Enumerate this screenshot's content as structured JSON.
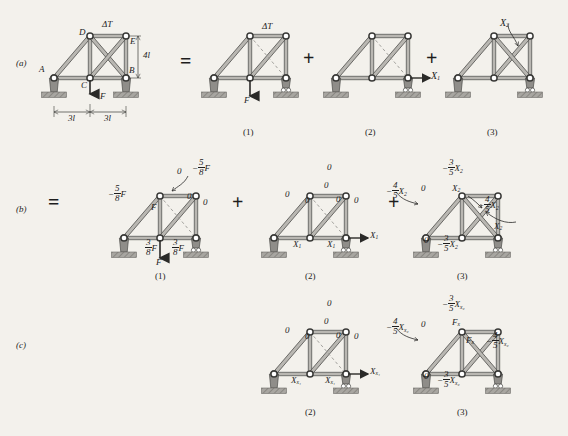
{
  "figure": {
    "caption_rows": [
      {
        "id": "row-a",
        "label": "(a)"
      },
      {
        "id": "row-b",
        "label": "(b)"
      },
      {
        "id": "row-c",
        "label": "(c)"
      }
    ],
    "operators": {
      "equals": "=",
      "plus": "+"
    }
  },
  "row_a": {
    "label": "(a)",
    "panel_0": {
      "joint_labels": {
        "A": "A",
        "B": "B",
        "C": "C",
        "D": "D",
        "E": "E"
      },
      "temperature_label": "ΔT",
      "height_dim": "4l",
      "span_left": "3l",
      "span_right": "3l",
      "load_label": "F"
    },
    "panel_1": {
      "number": "(1)",
      "temperature_label": "ΔT",
      "load_label": "F"
    },
    "panel_2": {
      "number": "(2)",
      "redundant_label": "X",
      "redundant_sub": "1"
    },
    "panel_3": {
      "number": "(3)",
      "redundant_label": "X",
      "redundant_sub": "2"
    }
  },
  "row_b": {
    "label": "(b)",
    "panel_1": {
      "number": "(1)",
      "top_chord": "0",
      "top_right_force": {
        "sign": "−",
        "num": "5",
        "den": "8",
        "symbol": "F"
      },
      "left_diagonal_force": {
        "sign": "−",
        "num": "5",
        "den": "8",
        "symbol": "F"
      },
      "vertical_force": "F",
      "diag_zero": "0",
      "right_vertical_zero": "0",
      "bottom_left_force": {
        "num": "3",
        "den": "8",
        "symbol": "F"
      },
      "bottom_right_force": {
        "num": "3",
        "den": "8",
        "symbol": "F"
      },
      "load_label": "F"
    },
    "panel_2": {
      "number": "(2)",
      "top_zero": "0",
      "left_diag_zero": "0",
      "inner_diag_zero": "0",
      "center_vertical_zero": "0",
      "right_diag_zero": "0",
      "right_vertical_zero": "0",
      "bottom_left": {
        "symbol": "X",
        "sub": "1"
      },
      "bottom_right": {
        "symbol": "X",
        "sub": "1"
      },
      "applied": {
        "symbol": "X",
        "sub": "1"
      }
    },
    "panel_3": {
      "number": "(3)",
      "top_force": {
        "sign": "−",
        "num": "3",
        "den": "5",
        "symbol": "X",
        "sub": "2"
      },
      "left_force": {
        "sign": "−",
        "num": "4",
        "den": "5",
        "symbol": "X",
        "sub": "2"
      },
      "left_zero": "0",
      "diag_label": {
        "symbol": "X",
        "sub": "2"
      },
      "right_force": {
        "sign": "−",
        "num": "4",
        "den": "5",
        "symbol": "X",
        "sub": "2"
      },
      "right_diag_label": {
        "symbol": "X",
        "sub": "2"
      },
      "bottom_zero": "0",
      "bottom_force": {
        "sign": "−",
        "num": "3",
        "den": "5",
        "symbol": "X",
        "sub": "2"
      }
    }
  },
  "row_c": {
    "label": "(c)",
    "panel_2": {
      "number": "(2)",
      "top_zero": "0",
      "left_diag_zero": "0",
      "inner_diag_zero": "0",
      "center_vertical_zero": "0",
      "right_diag_zero": "0",
      "right_vertical_zero": "0",
      "bottom_left": {
        "symbol": "X",
        "sub": "x₁"
      },
      "bottom_right": {
        "symbol": "X",
        "sub": "x₁"
      },
      "applied": {
        "symbol": "X",
        "sub": "x₁"
      }
    },
    "panel_3": {
      "number": "(3)",
      "top_force": {
        "sign": "−",
        "num": "3",
        "den": "5",
        "symbol": "X",
        "sub": "x₂"
      },
      "left_force": {
        "sign": "−",
        "num": "4",
        "den": "5",
        "symbol": "X",
        "sub": "x₂"
      },
      "left_zero": "0",
      "diag_label": {
        "symbol": "F",
        "sub": "x"
      },
      "right_diag_label": {
        "symbol": "F",
        "sub": "x"
      },
      "right_force": {
        "sign": "−",
        "num": "4",
        "den": "5",
        "symbol": "X",
        "sub": "x₂"
      },
      "bottom_zero": "0",
      "bottom_force": {
        "sign": "−",
        "num": "3",
        "den": "5",
        "symbol": "X",
        "sub": "x₂"
      }
    }
  },
  "colors": {
    "page_background": "#f3f1ec",
    "member_fill": "#b9b7b2",
    "member_stroke": "#4a4a48",
    "joint_fill": "#ffffff",
    "joint_stroke": "#3a3a38",
    "support_fill": "#8f8d89",
    "ground_fill": "#a8a6a1",
    "text": "#1d1d1d",
    "dashed_line": "#9a9894"
  }
}
